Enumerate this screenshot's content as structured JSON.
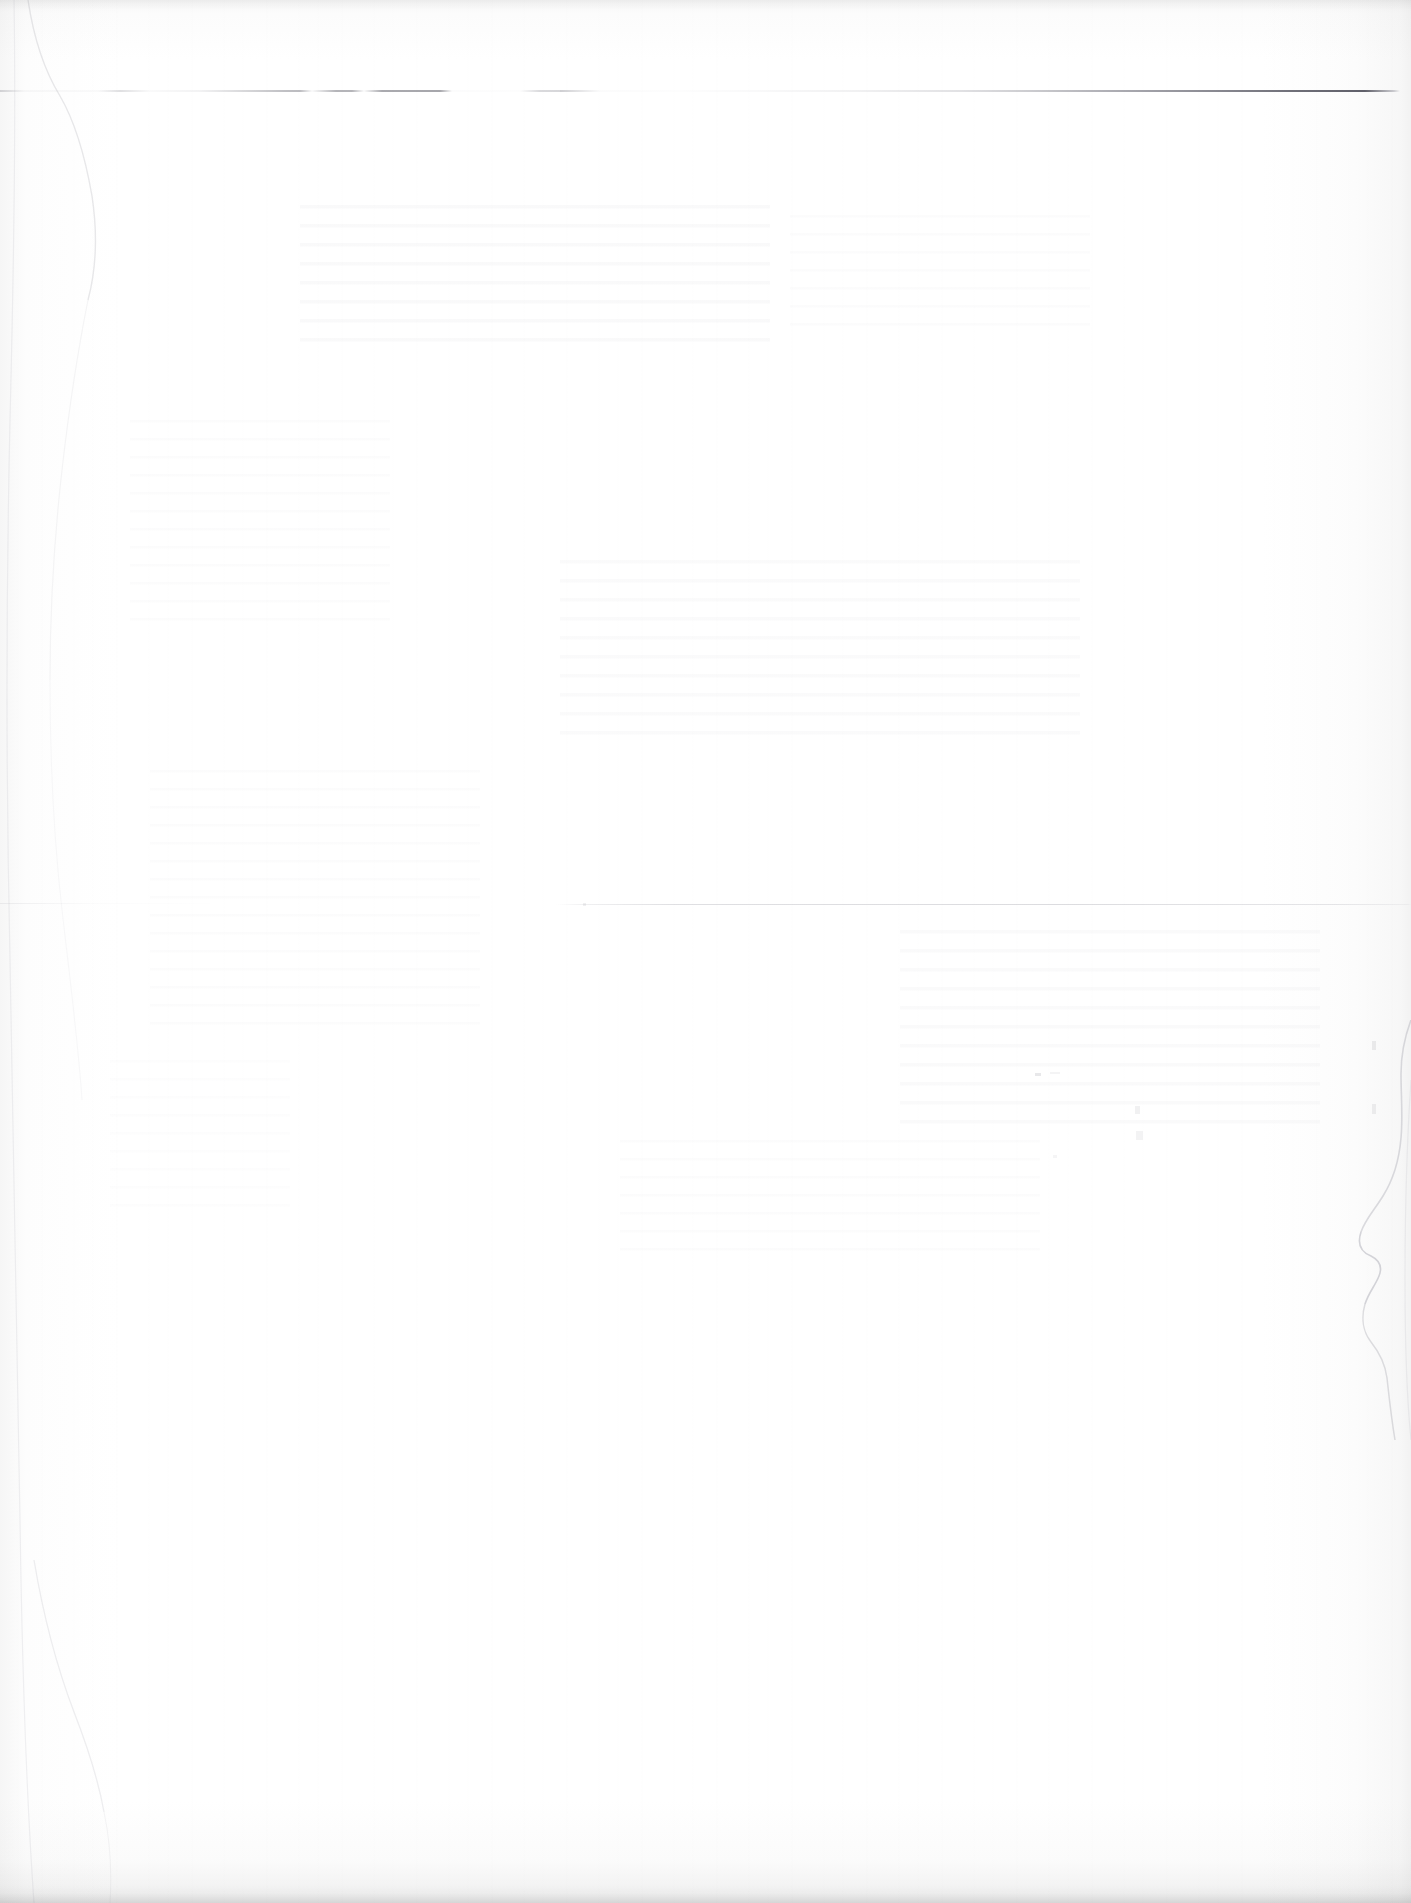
{
  "document": {
    "kind": "scanned-page",
    "content_state": "blank",
    "description": "Blank scanned paper page with no legible text",
    "page_width": 1411,
    "page_height": 1903,
    "paper_color": "#fefefe",
    "ink_color": "#55555f"
  },
  "marks": {
    "rules": [
      {
        "name": "top-horizontal-rule",
        "y": 90,
        "x_start": 0,
        "x_end": 1400,
        "style": "broken-left-solid-right",
        "note": "faint dashed segments at left, darkening to a solid line toward the right margin"
      },
      {
        "name": "lower-horizontal-rule",
        "y": 904,
        "x_start": 556,
        "x_end": 1411,
        "style": "hairline",
        "note": "very faint hairline crossing the lower half of the page"
      }
    ],
    "edges": [
      {
        "name": "right-margin-tear",
        "x": 1321,
        "y_start": 1020,
        "y_end": 1440,
        "note": "wavy paper edge / tear artifact along the right margin"
      },
      {
        "name": "left-margin-crease",
        "x": 20,
        "y_start": 0,
        "y_end": 1903,
        "note": "soft vertical crease near the left edge"
      }
    ],
    "artifacts": [
      {
        "name": "vertical-scan-streaks",
        "note": "faint vertical banding from the scanner"
      },
      {
        "name": "show-through-ghost-text",
        "note": "illegible bleed-through from the reverse side"
      },
      {
        "name": "bottom-edge-shadow",
        "note": "grey shadow band along the bottom page edge"
      }
    ]
  },
  "text": {
    "visible_text": "",
    "legible_characters": 0,
    "note": "No readable text, headings, numbers, or labels are present on this page."
  }
}
